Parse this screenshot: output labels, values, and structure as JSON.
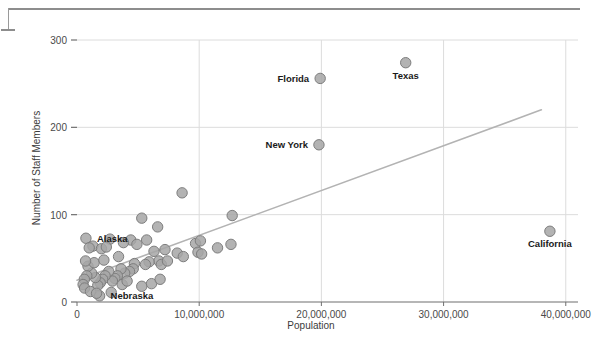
{
  "chart_data": {
    "type": "scatter",
    "title": "",
    "xlabel": "Population",
    "ylabel": "Number of Staff Members",
    "xlim": [
      0,
      41000000
    ],
    "ylim": [
      0,
      300
    ],
    "xticks": [
      0,
      10000000,
      20000000,
      30000000,
      40000000
    ],
    "xtick_labels": [
      "0",
      "10,000,000",
      "20,000,000",
      "30,000,000",
      "40,000,000"
    ],
    "yticks": [
      0,
      100,
      200,
      300
    ],
    "ytick_labels": [
      "0",
      "100",
      "200",
      "300"
    ],
    "grid": true,
    "legend": null,
    "marker_color": "#a6a6a6",
    "marker_edge_color": "#7d7d7d",
    "trendline": {
      "color": "#b3b3b3",
      "x_start": 0,
      "y_start": 25,
      "x_end": 38000000,
      "y_end": 220
    },
    "annotations": [
      {
        "label": "Florida",
        "x": 19900000,
        "y": 256,
        "label_side": "left"
      },
      {
        "label": "Texas",
        "x": 26900000,
        "y": 274,
        "label_side": "below"
      },
      {
        "label": "New York",
        "x": 19800000,
        "y": 180,
        "label_side": "left"
      },
      {
        "label": "California",
        "x": 38700000,
        "y": 81,
        "label_side": "below"
      },
      {
        "label": "Alaska",
        "x": 730000,
        "y": 73,
        "label_side": "right"
      },
      {
        "label": "Nebraska",
        "x": 1850000,
        "y": 7,
        "label_side": "right"
      }
    ],
    "points": [
      {
        "x": 19900000,
        "y": 256
      },
      {
        "x": 26900000,
        "y": 274
      },
      {
        "x": 19800000,
        "y": 180
      },
      {
        "x": 38700000,
        "y": 81
      },
      {
        "x": 8600000,
        "y": 125
      },
      {
        "x": 12700000,
        "y": 99
      },
      {
        "x": 5300000,
        "y": 96
      },
      {
        "x": 6600000,
        "y": 86
      },
      {
        "x": 730000,
        "y": 73
      },
      {
        "x": 2700000,
        "y": 72
      },
      {
        "x": 4400000,
        "y": 71
      },
      {
        "x": 5700000,
        "y": 71
      },
      {
        "x": 1300000,
        "y": 64
      },
      {
        "x": 1000000,
        "y": 62
      },
      {
        "x": 2000000,
        "y": 61
      },
      {
        "x": 2400000,
        "y": 63
      },
      {
        "x": 9700000,
        "y": 67
      },
      {
        "x": 10100000,
        "y": 70
      },
      {
        "x": 11500000,
        "y": 62
      },
      {
        "x": 12600000,
        "y": 66
      },
      {
        "x": 9900000,
        "y": 57
      },
      {
        "x": 10200000,
        "y": 55
      },
      {
        "x": 8200000,
        "y": 56
      },
      {
        "x": 8700000,
        "y": 52
      },
      {
        "x": 6300000,
        "y": 58
      },
      {
        "x": 6700000,
        "y": 47
      },
      {
        "x": 6900000,
        "y": 43
      },
      {
        "x": 5900000,
        "y": 46
      },
      {
        "x": 5600000,
        "y": 43
      },
      {
        "x": 4700000,
        "y": 44
      },
      {
        "x": 4600000,
        "y": 38
      },
      {
        "x": 4300000,
        "y": 35
      },
      {
        "x": 3900000,
        "y": 33
      },
      {
        "x": 3600000,
        "y": 38
      },
      {
        "x": 3300000,
        "y": 30
      },
      {
        "x": 3100000,
        "y": 27
      },
      {
        "x": 2900000,
        "y": 24
      },
      {
        "x": 2600000,
        "y": 35
      },
      {
        "x": 2300000,
        "y": 30
      },
      {
        "x": 2100000,
        "y": 26
      },
      {
        "x": 1900000,
        "y": 22
      },
      {
        "x": 1700000,
        "y": 19
      },
      {
        "x": 1500000,
        "y": 28
      },
      {
        "x": 1200000,
        "y": 33
      },
      {
        "x": 900000,
        "y": 41
      },
      {
        "x": 800000,
        "y": 30
      },
      {
        "x": 600000,
        "y": 26
      },
      {
        "x": 500000,
        "y": 20
      },
      {
        "x": 620000,
        "y": 16
      },
      {
        "x": 1850000,
        "y": 7
      },
      {
        "x": 1100000,
        "y": 12
      },
      {
        "x": 1600000,
        "y": 10
      },
      {
        "x": 2800000,
        "y": 11
      },
      {
        "x": 5300000,
        "y": 18
      },
      {
        "x": 6100000,
        "y": 21
      },
      {
        "x": 6800000,
        "y": 26
      },
      {
        "x": 7400000,
        "y": 47
      },
      {
        "x": 3700000,
        "y": 20
      },
      {
        "x": 4100000,
        "y": 24
      },
      {
        "x": 1400000,
        "y": 45
      },
      {
        "x": 700000,
        "y": 47
      },
      {
        "x": 2200000,
        "y": 48
      },
      {
        "x": 3400000,
        "y": 52
      },
      {
        "x": 3800000,
        "y": 68
      },
      {
        "x": 4900000,
        "y": 66
      },
      {
        "x": 7200000,
        "y": 60
      }
    ]
  }
}
